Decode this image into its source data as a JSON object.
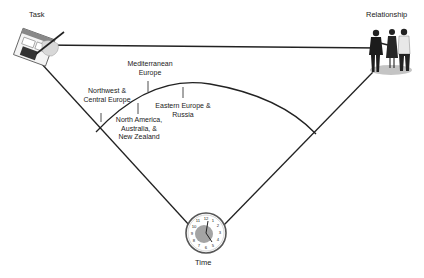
{
  "corners": {
    "task": {
      "label": "Task",
      "icon": "task-icon"
    },
    "relationship": {
      "label": "Relationship",
      "icon": "people-meeting-icon"
    },
    "time": {
      "label": "Time",
      "icon": "clock-icon"
    }
  },
  "regions": [
    {
      "id": "northwest",
      "line1": "Northwest &",
      "line2": "Central Europe"
    },
    {
      "id": "mediterranean",
      "line1": "Mediterranean",
      "line2": "Europe"
    },
    {
      "id": "north-america",
      "line1": "North America,",
      "line2": "Australia, &",
      "line3": "New Zealand"
    },
    {
      "id": "eastern",
      "line1": "Eastern Europe &",
      "line2": "Russia"
    }
  ],
  "clock_numbers": [
    "12",
    "1",
    "2",
    "3",
    "4",
    "5",
    "6",
    "7",
    "8",
    "9",
    "10",
    "11"
  ],
  "colors": {
    "line": "#222222",
    "clock_face": "#9a9a9a",
    "ground": "#bdbdbd"
  }
}
